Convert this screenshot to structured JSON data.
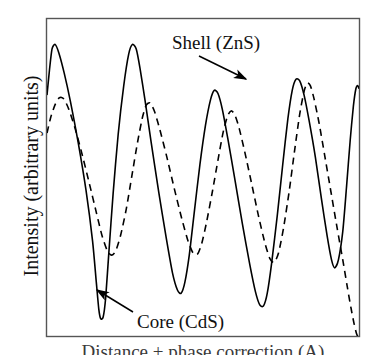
{
  "figure": {
    "title": "",
    "ylabel": "Intensity (arbitrary units)",
    "xlabel": "Distance + phase correction (A)",
    "frame_color": "#555555",
    "background": "#ffffff"
  },
  "annotations": {
    "shell": {
      "label": "Shell (ZnS)",
      "points_to": "dashed-curve",
      "text_x": 172,
      "text_y": 42,
      "arrow_from": [
        199,
        52
      ],
      "arrow_to": [
        249,
        80
      ]
    },
    "core": {
      "label": "Core (CdS)",
      "points_to": "solid-curve",
      "text_x": 137,
      "text_y": 322,
      "arrow_from": [
        133,
        310
      ],
      "arrow_to": [
        95,
        288
      ]
    }
  },
  "chart_data": {
    "type": "line",
    "title": "",
    "xlabel": "Distance + phase correction (A)",
    "ylabel": "Intensity (arbitrary units)",
    "xlim": [
      0,
      1
    ],
    "ylim": [
      0,
      1
    ],
    "grid": false,
    "legend": "annotations",
    "axis_ticks": false,
    "series": [
      {
        "name": "Core (CdS)",
        "style": "solid",
        "color": "#000000",
        "line_width": 1.6,
        "points": [
          [
            0.0,
            0.76
          ],
          [
            0.008,
            0.84
          ],
          [
            0.016,
            0.905
          ],
          [
            0.026,
            0.92
          ],
          [
            0.038,
            0.893
          ],
          [
            0.055,
            0.83
          ],
          [
            0.075,
            0.74
          ],
          [
            0.1,
            0.61
          ],
          [
            0.125,
            0.46
          ],
          [
            0.146,
            0.3
          ],
          [
            0.158,
            0.17
          ],
          [
            0.166,
            0.085
          ],
          [
            0.172,
            0.055
          ],
          [
            0.18,
            0.06
          ],
          [
            0.188,
            0.12
          ],
          [
            0.198,
            0.26
          ],
          [
            0.212,
            0.45
          ],
          [
            0.228,
            0.635
          ],
          [
            0.246,
            0.79
          ],
          [
            0.262,
            0.89
          ],
          [
            0.274,
            0.92
          ],
          [
            0.286,
            0.905
          ],
          [
            0.298,
            0.845
          ],
          [
            0.314,
            0.745
          ],
          [
            0.334,
            0.61
          ],
          [
            0.358,
            0.455
          ],
          [
            0.382,
            0.31
          ],
          [
            0.402,
            0.2
          ],
          [
            0.418,
            0.145
          ],
          [
            0.43,
            0.135
          ],
          [
            0.442,
            0.17
          ],
          [
            0.456,
            0.255
          ],
          [
            0.472,
            0.39
          ],
          [
            0.49,
            0.54
          ],
          [
            0.508,
            0.665
          ],
          [
            0.524,
            0.745
          ],
          [
            0.536,
            0.775
          ],
          [
            0.548,
            0.765
          ],
          [
            0.562,
            0.715
          ],
          [
            0.58,
            0.62
          ],
          [
            0.602,
            0.495
          ],
          [
            0.626,
            0.355
          ],
          [
            0.65,
            0.225
          ],
          [
            0.668,
            0.14
          ],
          [
            0.682,
            0.098
          ],
          [
            0.694,
            0.095
          ],
          [
            0.706,
            0.135
          ],
          [
            0.72,
            0.23
          ],
          [
            0.738,
            0.38
          ],
          [
            0.756,
            0.545
          ],
          [
            0.772,
            0.685
          ],
          [
            0.786,
            0.775
          ],
          [
            0.798,
            0.81
          ],
          [
            0.81,
            0.805
          ],
          [
            0.824,
            0.76
          ],
          [
            0.84,
            0.68
          ],
          [
            0.86,
            0.565
          ],
          [
            0.88,
            0.43
          ],
          [
            0.898,
            0.315
          ],
          [
            0.912,
            0.24
          ],
          [
            0.922,
            0.215
          ],
          [
            0.934,
            0.24
          ],
          [
            0.948,
            0.33
          ],
          [
            0.96,
            0.47
          ],
          [
            0.972,
            0.62
          ],
          [
            0.982,
            0.725
          ],
          [
            0.99,
            0.78
          ],
          [
            0.996,
            0.79
          ],
          [
            1.0,
            0.78
          ]
        ]
      },
      {
        "name": "Shell (ZnS)",
        "style": "dashed",
        "color": "#000000",
        "line_width": 1.6,
        "dash_pattern": "7 5",
        "points": [
          [
            0.0,
            0.64
          ],
          [
            0.012,
            0.69
          ],
          [
            0.026,
            0.73
          ],
          [
            0.04,
            0.752
          ],
          [
            0.054,
            0.748
          ],
          [
            0.07,
            0.715
          ],
          [
            0.09,
            0.655
          ],
          [
            0.112,
            0.575
          ],
          [
            0.136,
            0.48
          ],
          [
            0.158,
            0.39
          ],
          [
            0.176,
            0.318
          ],
          [
            0.192,
            0.272
          ],
          [
            0.206,
            0.255
          ],
          [
            0.22,
            0.268
          ],
          [
            0.236,
            0.318
          ],
          [
            0.254,
            0.4
          ],
          [
            0.272,
            0.505
          ],
          [
            0.29,
            0.61
          ],
          [
            0.306,
            0.69
          ],
          [
            0.318,
            0.728
          ],
          [
            0.33,
            0.735
          ],
          [
            0.344,
            0.71
          ],
          [
            0.362,
            0.65
          ],
          [
            0.384,
            0.565
          ],
          [
            0.408,
            0.465
          ],
          [
            0.432,
            0.37
          ],
          [
            0.452,
            0.3
          ],
          [
            0.468,
            0.262
          ],
          [
            0.482,
            0.258
          ],
          [
            0.496,
            0.292
          ],
          [
            0.512,
            0.362
          ],
          [
            0.53,
            0.455
          ],
          [
            0.548,
            0.555
          ],
          [
            0.564,
            0.64
          ],
          [
            0.578,
            0.692
          ],
          [
            0.59,
            0.71
          ],
          [
            0.602,
            0.698
          ],
          [
            0.616,
            0.655
          ],
          [
            0.634,
            0.58
          ],
          [
            0.656,
            0.48
          ],
          [
            0.678,
            0.378
          ],
          [
            0.698,
            0.295
          ],
          [
            0.714,
            0.245
          ],
          [
            0.728,
            0.232
          ],
          [
            0.742,
            0.262
          ],
          [
            0.758,
            0.34
          ],
          [
            0.776,
            0.455
          ],
          [
            0.794,
            0.588
          ],
          [
            0.81,
            0.7
          ],
          [
            0.824,
            0.772
          ],
          [
            0.834,
            0.798
          ],
          [
            0.844,
            0.79
          ],
          [
            0.856,
            0.748
          ],
          [
            0.872,
            0.672
          ],
          [
            0.89,
            0.57
          ],
          [
            0.91,
            0.455
          ],
          [
            0.93,
            0.34
          ],
          [
            0.948,
            0.24
          ],
          [
            0.962,
            0.158
          ],
          [
            0.974,
            0.09
          ],
          [
            0.984,
            0.04
          ],
          [
            0.992,
            0.008
          ],
          [
            1.0,
            -0.01
          ]
        ]
      }
    ]
  }
}
